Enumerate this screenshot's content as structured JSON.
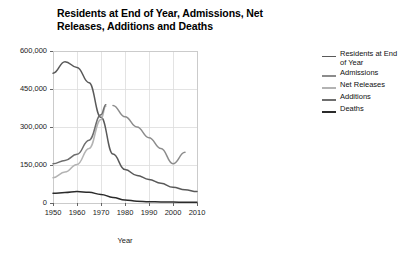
{
  "chart_data": {
    "type": "line",
    "title": "Residents at End of Year, Admissions, Net Releases, Additions and Deaths",
    "xlabel": "Year",
    "ylabel": "",
    "xlim": [
      1950,
      2010
    ],
    "ylim": [
      0,
      600000
    ],
    "grid": true,
    "legend_position": "right",
    "xticks": [
      "1950",
      "1960",
      "1970",
      "1980",
      "1990",
      "2000",
      "2010"
    ],
    "xtick_values": [
      1950,
      1960,
      1970,
      1980,
      1990,
      2000,
      2010
    ],
    "yticks": [
      "0",
      "150,000",
      "300,000",
      "450,000",
      "600,000"
    ],
    "ytick_values": [
      0,
      150000,
      300000,
      450000,
      600000
    ],
    "series": [
      {
        "name": "Residents at End of Year",
        "color": "#595959",
        "x": [
          1950,
          1955,
          1960,
          1965,
          1970,
          1975,
          1980,
          1985,
          1990,
          1995,
          2000,
          2005,
          2010
        ],
        "values": [
          512000,
          558000,
          535000,
          475000,
          338000,
          193000,
          132000,
          109000,
          93000,
          78000,
          62000,
          52000,
          45000
        ]
      },
      {
        "name": "Admissions",
        "color": "#8c8c8c",
        "x": [
          1975,
          1980,
          1985,
          1990,
          1995,
          2000,
          2005
        ],
        "values": [
          385000,
          340000,
          300000,
          258000,
          215000,
          155000,
          200000
        ]
      },
      {
        "name": "Net Releases",
        "color": "#b3b3b3",
        "x": [
          1950,
          1955,
          1960,
          1965,
          1970,
          1972
        ],
        "values": [
          100000,
          122000,
          152000,
          215000,
          330000,
          382000
        ]
      },
      {
        "name": "Additions",
        "color": "#6e6e6e",
        "x": [
          1950,
          1955,
          1960,
          1965,
          1970,
          1972
        ],
        "values": [
          155000,
          168000,
          192000,
          248000,
          348000,
          388000
        ]
      },
      {
        "name": "Deaths",
        "color": "#2b2b2b",
        "x": [
          1950,
          1955,
          1960,
          1965,
          1970,
          1975,
          1980,
          1985,
          1990,
          1995,
          2000,
          2005,
          2010
        ],
        "values": [
          38000,
          41000,
          45000,
          42000,
          34000,
          22000,
          12000,
          7000,
          5000,
          4000,
          3500,
          3200,
          3000
        ]
      }
    ]
  },
  "legend": {
    "items": [
      {
        "label": "Residents at End of Year",
        "color": "#595959"
      },
      {
        "label": "Admissions",
        "color": "#8c8c8c"
      },
      {
        "label": "Net Releases",
        "color": "#b3b3b3"
      },
      {
        "label": "Additions",
        "color": "#6e6e6e"
      },
      {
        "label": "Deaths",
        "color": "#2b2b2b"
      }
    ]
  },
  "axes": {
    "x_title": "Year",
    "x_tick_labels": [
      "1950",
      "1960",
      "1970",
      "1980",
      "1990",
      "2000",
      "2010"
    ],
    "y_tick_labels": [
      "600,000",
      "450,000",
      "300,000",
      "150,000",
      "0"
    ]
  },
  "style": {
    "frame_color": "#c8c8c8",
    "grid_color": "#dcdcdc",
    "background": "#ffffff"
  }
}
